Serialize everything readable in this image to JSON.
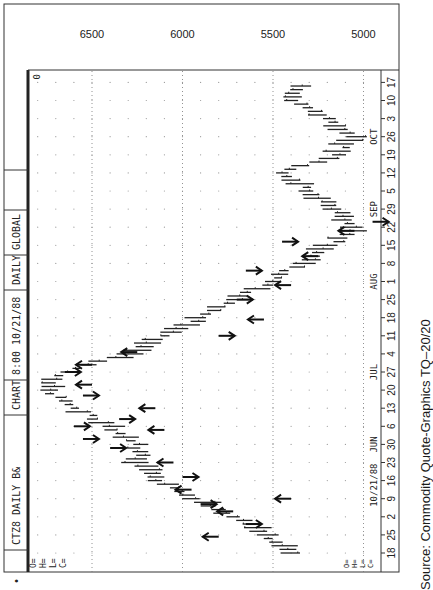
{
  "header": {
    "symbol": "CTZ8",
    "period": "DAILY",
    "chart_type": "BAR CHART",
    "time": "8:00",
    "date": "10/21/88",
    "frequency": "DAILY",
    "mode": "GLOBAL",
    "corner_value": "0"
  },
  "ohlc_labels": [
    "O=",
    "H=",
    "L=",
    "C="
  ],
  "date_stamp": "10/21/88",
  "source": "Source:  Commodity Quote-Graphics TQ–20/20",
  "chart_data": {
    "type": "bar",
    "subtype": "ohlc-daily-bar",
    "orientation": "rotated 90 degrees (time axis vertical on right, price axis horizontal at top)",
    "xlabel": "",
    "ylabel": "",
    "ylim": [
      4900,
      6800
    ],
    "price_ticks": [
      6500,
      6000,
      5500,
      5000
    ],
    "month_labels": [
      {
        "label": "JUN",
        "week_index": 6
      },
      {
        "label": "JUL",
        "week_index": 10
      },
      {
        "label": "AUG",
        "week_index": 15
      },
      {
        "label": "SEP",
        "week_index": 19
      },
      {
        "label": "OCT",
        "week_index": 23
      }
    ],
    "x_tick_labels": [
      "18",
      "25",
      "2",
      "9",
      "16",
      "23",
      "30",
      "6",
      "13",
      "20",
      "27",
      "4",
      "11",
      "18",
      "25",
      "1",
      "8",
      "15",
      "22",
      "29",
      "5",
      "12",
      "19",
      "26",
      "3",
      "10",
      "17"
    ],
    "grid": true,
    "weekly_closes": {
      "categories": [
        "May 18",
        "May 25",
        "Jun 2",
        "Jun 9",
        "Jun 16",
        "Jun 23",
        "Jun 30",
        "Jul 6",
        "Jul 13",
        "Jun 20",
        "Jun 27",
        "Jul 4",
        "Jul 11",
        "Jul 18",
        "Jul 25",
        "Aug 1",
        "Aug 8",
        "Aug 15",
        "Aug 22",
        "Aug 29",
        "Sep 5",
        "Sep 12",
        "Sep 19",
        "Sep 26",
        "Oct 3",
        "Oct 10",
        "Oct 17"
      ],
      "values": [
        5405,
        5545,
        5710,
        5930,
        6125,
        6235,
        6260,
        6400,
        6595,
        6760,
        6675,
        6290,
        6100,
        5900,
        5710,
        5515,
        5350,
        5185,
        5050,
        5160,
        5295,
        5460,
        5160,
        5050,
        5215,
        5405,
        5350
      ]
    },
    "annotations": {
      "buy_arrows_count": 14,
      "sell_arrows_count": 14,
      "note": "Hand-drawn arrows mark buy (pointing up-price) and sell (pointing down-price) signals along the bars"
    }
  }
}
